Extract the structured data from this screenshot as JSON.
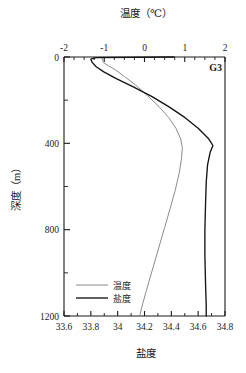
{
  "chart_data": {
    "type": "line",
    "title": "",
    "station_label": "G3",
    "orientation": "vertical-profile",
    "grid": false,
    "legend_position": "bottom-left-inside",
    "axes": {
      "top": {
        "name": "temperature",
        "label": "温度（℃）",
        "unit": "℃",
        "min": -2,
        "max": 2,
        "ticks": [
          -2,
          -1,
          0,
          1,
          2
        ],
        "tick_labels": [
          "-2",
          "-1",
          "0",
          "1",
          "2"
        ],
        "minor_ticks": [
          -1.75,
          -1.5,
          -1.25,
          -0.75,
          -0.5,
          -0.25,
          0.25,
          0.5,
          0.75,
          1.25,
          1.5,
          1.75
        ]
      },
      "bottom": {
        "name": "salinity",
        "label": "盐度",
        "unit": "",
        "min": 33.6,
        "max": 34.8,
        "ticks": [
          33.6,
          33.8,
          34,
          34.2,
          34.4,
          34.6,
          34.8
        ],
        "tick_labels": [
          "33.6",
          "33.8",
          "34",
          "34.2",
          "34.4",
          "34.6",
          "34.8"
        ],
        "minor_ticks": [
          33.7,
          33.9,
          34.1,
          34.3,
          34.5,
          34.7
        ]
      },
      "left": {
        "name": "depth",
        "label": "深度（m）",
        "unit": "m",
        "min": 0,
        "max": 1200,
        "inverted": true,
        "ticks": [
          0,
          400,
          800,
          1200
        ],
        "tick_labels": [
          "0",
          "400",
          "800",
          "1200"
        ],
        "minor_ticks": [
          200,
          600,
          1000
        ]
      }
    },
    "series": [
      {
        "name": "温度",
        "legend_label": "温度",
        "axis": "top",
        "color": "#8c8c8c",
        "unit": "℃",
        "points": [
          {
            "depth": 0,
            "value": -1.05
          },
          {
            "depth": 10,
            "value": -1.05
          },
          {
            "depth": 25,
            "value": -1.02
          },
          {
            "depth": 40,
            "value": -0.9
          },
          {
            "depth": 60,
            "value": -0.72
          },
          {
            "depth": 90,
            "value": -0.5
          },
          {
            "depth": 130,
            "value": -0.22
          },
          {
            "depth": 180,
            "value": 0.08
          },
          {
            "depth": 230,
            "value": 0.36
          },
          {
            "depth": 280,
            "value": 0.6
          },
          {
            "depth": 330,
            "value": 0.78
          },
          {
            "depth": 380,
            "value": 0.9
          },
          {
            "depth": 420,
            "value": 0.94
          },
          {
            "depth": 470,
            "value": 0.92
          },
          {
            "depth": 540,
            "value": 0.86
          },
          {
            "depth": 620,
            "value": 0.76
          },
          {
            "depth": 700,
            "value": 0.64
          },
          {
            "depth": 790,
            "value": 0.5
          },
          {
            "depth": 880,
            "value": 0.36
          },
          {
            "depth": 970,
            "value": 0.22
          },
          {
            "depth": 1060,
            "value": 0.08
          },
          {
            "depth": 1140,
            "value": -0.04
          },
          {
            "depth": 1200,
            "value": -0.12
          }
        ]
      },
      {
        "name": "盐度",
        "legend_label": "盐度",
        "axis": "bottom",
        "color": "#141414",
        "unit": "",
        "points": [
          {
            "depth": 0,
            "value": 34.42
          },
          {
            "depth": 3,
            "value": 33.84
          },
          {
            "depth": 10,
            "value": 33.8
          },
          {
            "depth": 25,
            "value": 33.81
          },
          {
            "depth": 45,
            "value": 33.84
          },
          {
            "depth": 70,
            "value": 33.9
          },
          {
            "depth": 100,
            "value": 33.99
          },
          {
            "depth": 140,
            "value": 34.12
          },
          {
            "depth": 185,
            "value": 34.26
          },
          {
            "depth": 230,
            "value": 34.38
          },
          {
            "depth": 280,
            "value": 34.5
          },
          {
            "depth": 330,
            "value": 34.6
          },
          {
            "depth": 380,
            "value": 34.68
          },
          {
            "depth": 410,
            "value": 34.71
          },
          {
            "depth": 440,
            "value": 34.69
          },
          {
            "depth": 500,
            "value": 34.67
          },
          {
            "depth": 580,
            "value": 34.66
          },
          {
            "depth": 680,
            "value": 34.655
          },
          {
            "depth": 800,
            "value": 34.65
          },
          {
            "depth": 920,
            "value": 34.65
          },
          {
            "depth": 1050,
            "value": 34.655
          },
          {
            "depth": 1150,
            "value": 34.66
          },
          {
            "depth": 1200,
            "value": 34.66
          }
        ]
      }
    ]
  },
  "legend": {
    "items": [
      {
        "label": "温度",
        "color": "#8c8c8c"
      },
      {
        "label": "盐度",
        "color": "#141414"
      }
    ]
  }
}
